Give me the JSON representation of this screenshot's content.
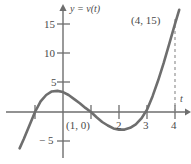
{
  "figure": {
    "name": "velocity-function-graph",
    "width": 191,
    "height": 164,
    "background": "#ffffff",
    "curve_color": "#6e6e6e",
    "axis_color": "#6e6e6e",
    "text_color": "#4a4a4a"
  },
  "labels": {
    "y_axis_label": "y = v(t)",
    "x_axis_label": "t",
    "point_1_0": "(1, 0)",
    "point_4_15": "(4, 15)",
    "y_tick_15": "15",
    "y_tick_10": "10",
    "y_tick_5": "5",
    "y_tick_minus5": "− 5",
    "x_tick_2": "2",
    "x_tick_3": "3",
    "x_tick_4": "4"
  },
  "chart_data": {
    "type": "line",
    "title": "",
    "xlabel": "t",
    "ylabel": "y = v(t)",
    "xlim": [
      -1.6,
      4.6
    ],
    "ylim": [
      -6.5,
      17.5
    ],
    "grid": false,
    "legend": null,
    "x_ticks": [
      -1,
      1,
      2,
      3,
      4
    ],
    "x_tick_labels": [
      "",
      "",
      "2",
      "3",
      "4"
    ],
    "y_ticks": [
      -5,
      5,
      10,
      15
    ],
    "y_tick_labels": [
      "− 5",
      "5",
      "10",
      "15"
    ],
    "series": [
      {
        "name": "v(t)",
        "color": "#6e6e6e",
        "x": [
          -1.55,
          -1.4,
          -1.2,
          -1.0,
          -0.8,
          -0.6,
          -0.4,
          -0.2,
          0.0,
          0.2,
          0.4,
          0.6,
          0.8,
          1.0,
          1.2,
          1.4,
          1.6,
          1.8,
          2.0,
          2.2,
          2.4,
          2.6,
          2.8,
          3.0,
          3.2,
          3.4,
          3.6,
          3.8,
          4.0,
          4.15
        ],
        "y": [
          -6.2,
          -4.6,
          -2.3,
          0.0,
          1.8,
          2.9,
          3.5,
          3.6,
          3.4,
          2.9,
          2.2,
          1.5,
          0.7,
          0.0,
          -0.9,
          -1.7,
          -2.3,
          -2.8,
          -3.0,
          -3.0,
          -2.7,
          -2.1,
          -1.1,
          0.4,
          2.7,
          5.4,
          8.4,
          11.7,
          15.0,
          17.4
        ]
      }
    ],
    "annotations": [
      {
        "label": "(1, 0)",
        "x": 1,
        "y": 0,
        "placement": "below-left"
      },
      {
        "label": "(4, 15)",
        "x": 4,
        "y": 15,
        "placement": "above-left"
      }
    ],
    "reference_lines": [
      {
        "kind": "vertical-dashed",
        "x": 4,
        "from_y": 0,
        "to_y": 16.5,
        "color": "#8a8a8a"
      }
    ]
  }
}
